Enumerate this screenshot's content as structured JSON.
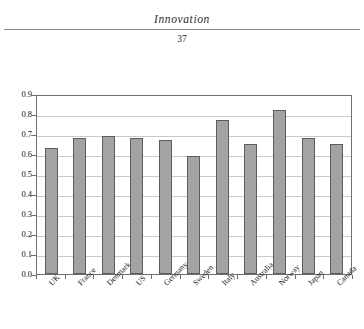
{
  "page": {
    "running_head": "Innovation",
    "folio": "37"
  },
  "chart_data": {
    "type": "bar",
    "title": "",
    "xlabel": "",
    "ylabel": "",
    "categories": [
      "UK",
      "France",
      "Denmark",
      "US",
      "Germany",
      "Sweden",
      "Italy",
      "Australia",
      "Norway",
      "Japan",
      "Canada"
    ],
    "values": [
      0.63,
      0.68,
      0.69,
      0.68,
      0.67,
      0.59,
      0.77,
      0.65,
      0.82,
      0.68,
      0.65
    ],
    "ylim": [
      0.0,
      0.9
    ],
    "ytick_labels": [
      "0.9",
      "0.8",
      "0.7",
      "0.6",
      "0.5",
      "0.4",
      "0.3",
      "0.2",
      "0.1",
      "0.0"
    ],
    "ytick_values": [
      0.9,
      0.8,
      0.7,
      0.6,
      0.5,
      0.4,
      0.3,
      0.2,
      0.1,
      0.0
    ],
    "grid": true,
    "legend": "none",
    "bar_color": "#a3a3a3",
    "bar_border_color": "#5d5d5d",
    "gridline_color": "#c9c9c9",
    "frame_color": "#6f6f6f"
  }
}
